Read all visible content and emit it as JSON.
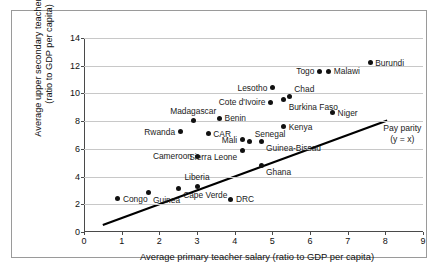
{
  "chart_data": {
    "type": "scatter",
    "title": "",
    "xlabel": "Average primary teacher salary (ratio to GDP per capita)",
    "ylabel_line1": "Average upper secondary teacher salary",
    "ylabel_line2": "(ratio to GDP per capita)",
    "xlim": [
      0,
      9
    ],
    "ylim": [
      0,
      14
    ],
    "xticks": [
      0,
      1,
      2,
      3,
      4,
      5,
      6,
      7,
      8,
      9
    ],
    "yticks": [
      0,
      2,
      4,
      6,
      8,
      10,
      12,
      14
    ],
    "xtick_labels": [
      "0",
      "1",
      "2",
      "3",
      "4",
      "5",
      "6",
      "7",
      "8",
      "9"
    ],
    "ytick_labels": [
      "0",
      "2",
      "4",
      "6",
      "8",
      "10",
      "12",
      "14"
    ],
    "grid": "horizontal",
    "legend": "none",
    "point_color": "#111111",
    "grid_color": "#c8c8c8",
    "axis_color": "#4a4a4a",
    "line_color": "#000000",
    "reference_line": {
      "name": "Pay parity",
      "label_line1": "Pay parity",
      "label_line2": "(y = x)",
      "equation": "y = x",
      "x_start": 0.5,
      "y_start": 0.5,
      "x_end": 8.05,
      "y_end": 8.05
    },
    "points": [
      {
        "label": "Congo",
        "x": 0.9,
        "y": 2.4,
        "label_pos": "right"
      },
      {
        "label": "Guinea",
        "x": 1.7,
        "y": 2.85,
        "label_pos": "below-right"
      },
      {
        "label": "Cape Verde",
        "x": 2.5,
        "y": 3.15,
        "label_pos": "below-right"
      },
      {
        "label": "Liberia",
        "x": 3.0,
        "y": 3.3,
        "label_pos": "above"
      },
      {
        "label": "DRC",
        "x": 3.9,
        "y": 2.35,
        "label_pos": "right"
      },
      {
        "label": "Cameroon",
        "x": 3.0,
        "y": 5.45,
        "label_pos": "left"
      },
      {
        "label": "Sierra Leone",
        "x": 4.2,
        "y": 5.9,
        "label_pos": "below-left"
      },
      {
        "label": "Ghana",
        "x": 4.7,
        "y": 4.8,
        "label_pos": "below-right"
      },
      {
        "label": "Guinea-Bissau",
        "x": 4.7,
        "y": 6.55,
        "label_pos": "below-right"
      },
      {
        "label": "Mali",
        "x": 4.2,
        "y": 6.65,
        "label_pos": "left"
      },
      {
        "label": "Senegal",
        "x": 4.4,
        "y": 6.55,
        "label_pos": "above-right"
      },
      {
        "label": "CAR",
        "x": 3.3,
        "y": 7.1,
        "label_pos": "right"
      },
      {
        "label": "Rwanda",
        "x": 2.55,
        "y": 7.25,
        "label_pos": "left"
      },
      {
        "label": "Kenya",
        "x": 5.3,
        "y": 7.6,
        "label_pos": "right"
      },
      {
        "label": "Madagascar",
        "x": 2.9,
        "y": 8.05,
        "label_pos": "above"
      },
      {
        "label": "Benin",
        "x": 3.6,
        "y": 8.2,
        "label_pos": "right"
      },
      {
        "label": "Niger",
        "x": 6.6,
        "y": 8.6,
        "label_pos": "right"
      },
      {
        "label": "Cote d'Ivoire",
        "x": 4.95,
        "y": 9.35,
        "label_pos": "left"
      },
      {
        "label": "Burkina Faso",
        "x": 5.3,
        "y": 9.55,
        "label_pos": "below-right"
      },
      {
        "label": "Chad",
        "x": 5.45,
        "y": 9.8,
        "label_pos": "above-right"
      },
      {
        "label": "Lesotho",
        "x": 5.0,
        "y": 10.4,
        "label_pos": "left"
      },
      {
        "label": "Togo",
        "x": 6.25,
        "y": 11.6,
        "label_pos": "left"
      },
      {
        "label": "Malawi",
        "x": 6.5,
        "y": 11.6,
        "label_pos": "right"
      },
      {
        "label": "Burundi",
        "x": 7.6,
        "y": 12.2,
        "label_pos": "right"
      }
    ]
  }
}
